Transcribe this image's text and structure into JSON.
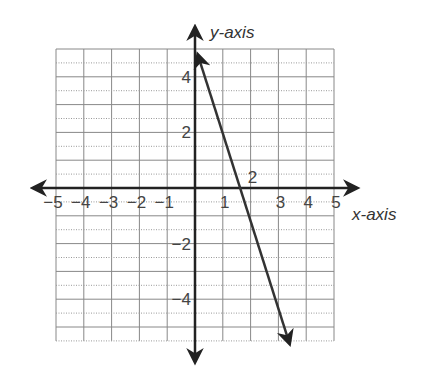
{
  "chart_data": {
    "type": "line",
    "title": "",
    "xlabel": "x-axis",
    "ylabel": "y-axis",
    "xlim": [
      -5,
      5
    ],
    "ylim": [
      -5.5,
      5
    ],
    "grid": true,
    "x_tick_labels": [
      "-5",
      "-4",
      "-3",
      "-2",
      "-1",
      "1",
      "2",
      "3",
      "4",
      "5"
    ],
    "y_tick_labels": [
      "4",
      "2",
      "-2",
      "-4"
    ],
    "series": [
      {
        "name": "line",
        "equation": "y = -3x + 5",
        "x": [
          0.1,
          3.4
        ],
        "y": [
          4.8,
          -5.6
        ],
        "color": "#333333"
      }
    ]
  },
  "labels": {
    "x_axis": "x-axis",
    "y_axis": "y-axis",
    "xticks": [
      {
        "t": "−5",
        "v": -5
      },
      {
        "t": "−4",
        "v": -4
      },
      {
        "t": "−3",
        "v": -3
      },
      {
        "t": "−2",
        "v": -2
      },
      {
        "t": "−1",
        "v": -1
      },
      {
        "t": "1",
        "v": 1
      },
      {
        "t": "2",
        "v": 2
      },
      {
        "t": "3",
        "v": 3
      },
      {
        "t": "4",
        "v": 4
      },
      {
        "t": "5",
        "v": 5
      }
    ],
    "yticks": [
      {
        "t": "4",
        "v": 4
      },
      {
        "t": "2",
        "v": 2
      },
      {
        "t": "−2",
        "v": -2
      },
      {
        "t": "−4",
        "v": -4
      }
    ]
  }
}
